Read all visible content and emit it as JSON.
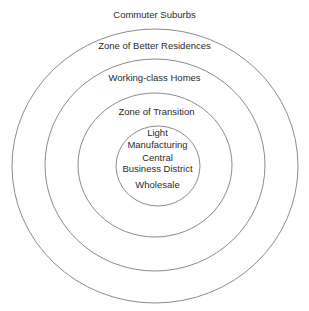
{
  "diagram": {
    "type": "concentric-zone-model",
    "rings": [
      {
        "name": "Commuter Suburbs",
        "label_y": 9
      },
      {
        "name": "Zone of Better Residences",
        "label_y": 40
      },
      {
        "name": "Working-class Homes",
        "label_y": 72
      },
      {
        "name": "Zone of Transition",
        "label_y": 106
      }
    ],
    "center": {
      "lines": [
        "Light",
        "Manufacturing",
        "Central",
        "Business District",
        "Wholesale"
      ]
    },
    "colors": {
      "line": "#8c8c8c",
      "text": "#2a2a2a",
      "background": "#ffffff"
    }
  }
}
